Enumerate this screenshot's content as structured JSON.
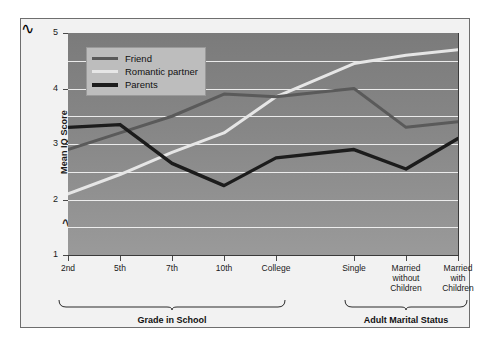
{
  "chart_data": {
    "type": "line",
    "title": "",
    "xlabel": "",
    "ylabel": "Mean IQ Score",
    "categories": [
      "2nd",
      "5th",
      "7th",
      "10th",
      "College",
      "Single",
      "Married\nwithout\nChildren",
      "Married\nwith\nChildren"
    ],
    "ylim": [
      1,
      5
    ],
    "yticks": [
      1,
      2,
      3,
      4,
      5
    ],
    "ytick_labels": [
      "1",
      "2",
      "3",
      "4",
      "5"
    ],
    "grid": true,
    "gridlines_at": [
      1.5,
      2,
      2.5,
      3,
      3.5,
      4,
      4.5
    ],
    "axis_break": true,
    "legend_position": "top-left",
    "series": [
      {
        "name": "Friend",
        "color": "#5a5a5a",
        "values": [
          2.9,
          3.2,
          3.5,
          3.9,
          3.85,
          4.0,
          3.3,
          3.4
        ]
      },
      {
        "name": "Romantic partner",
        "color": "#e6e6e6",
        "values": [
          2.1,
          2.45,
          2.85,
          3.2,
          3.85,
          4.45,
          4.6,
          4.7
        ]
      },
      {
        "name": "Parents",
        "color": "#1c1c1c",
        "values": [
          3.3,
          3.35,
          2.65,
          2.25,
          2.75,
          2.9,
          2.55,
          3.1
        ]
      }
    ],
    "groups": [
      {
        "label": "Grade in School",
        "from_index": 0,
        "to_index": 4
      },
      {
        "label": "Adult Marital Status",
        "from_index": 5,
        "to_index": 7
      }
    ]
  },
  "legend": {
    "items": [
      {
        "label": "Friend"
      },
      {
        "label": "Romantic partner"
      },
      {
        "label": "Parents"
      }
    ]
  },
  "colors": {
    "friend": "#5a5a5a",
    "romantic_partner": "#e6e6e6",
    "parents": "#1c1c1c",
    "plot_background_top": "#7b7b7b",
    "plot_background_bottom": "#9a9a9a",
    "gridline": "#f4f4f4",
    "figure_background": "#f2f2f2",
    "figure_border": "#6e6e6e",
    "legend_background": "#bdbdbd"
  }
}
